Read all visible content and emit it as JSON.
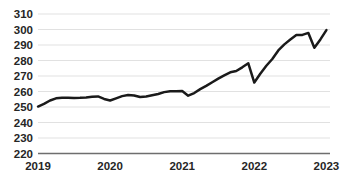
{
  "chart_data": {
    "type": "line",
    "title": "",
    "subtitle": "",
    "xlabel": "",
    "ylabel": "",
    "ylim": [
      220,
      310
    ],
    "xlim": [
      2019.0,
      2023.05
    ],
    "ytick_step": 10,
    "grid": true,
    "legend": null,
    "legend_position": "none",
    "line_color": "#1a1a1a",
    "grid_color": "#d9d9d9",
    "axis_color": "#6e6e6e",
    "ytick_labels": [
      "310",
      "300",
      "290",
      "280",
      "270",
      "260",
      "250",
      "240",
      "230",
      "220"
    ],
    "ytick_values": [
      310,
      300,
      290,
      280,
      270,
      260,
      250,
      240,
      230,
      220
    ],
    "xtick_labels": [
      "2019",
      "2020",
      "2021",
      "2022",
      "2023"
    ],
    "xtick_values": [
      2019,
      2020,
      2021,
      2022,
      2023
    ],
    "series": [
      {
        "name": "index",
        "x": [
          2019.0,
          2019.083,
          2019.167,
          2019.25,
          2019.333,
          2019.417,
          2019.5,
          2019.583,
          2019.667,
          2019.75,
          2019.833,
          2019.917,
          2020.0,
          2020.083,
          2020.167,
          2020.25,
          2020.333,
          2020.417,
          2020.5,
          2020.583,
          2020.667,
          2020.75,
          2020.833,
          2020.917,
          2021.0,
          2021.083,
          2021.167,
          2021.25,
          2021.333,
          2021.417,
          2021.5,
          2021.583,
          2021.667,
          2021.75,
          2021.833,
          2021.917,
          2022.0,
          2022.083,
          2022.167,
          2022.25,
          2022.333,
          2022.417,
          2022.5,
          2022.583,
          2022.667,
          2022.75,
          2022.833,
          2022.917,
          2023.0
        ],
        "values": [
          250.3,
          252.0,
          254.2,
          255.6,
          255.9,
          255.9,
          255.8,
          255.9,
          256.2,
          256.6,
          256.8,
          255.2,
          254.2,
          255.6,
          257.0,
          257.8,
          257.4,
          256.4,
          256.8,
          257.6,
          258.4,
          259.6,
          260.2,
          260.2,
          260.3,
          257.3,
          259.0,
          261.5,
          263.6,
          266.0,
          268.3,
          270.4,
          272.4,
          273.2,
          275.6,
          278.2,
          265.8,
          271.5,
          276.6,
          281.0,
          286.5,
          290.4,
          293.5,
          296.4,
          296.5,
          297.8,
          288.2,
          293.6,
          299.6
        ]
      }
    ]
  }
}
